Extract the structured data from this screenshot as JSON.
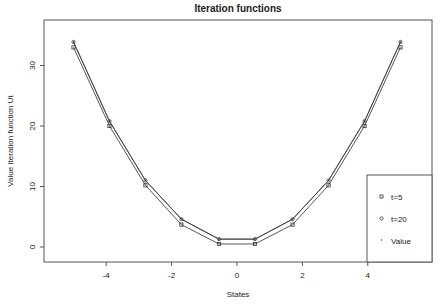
{
  "chart_data": {
    "type": "line",
    "title": "Iteration functions",
    "xlabel": "States",
    "ylabel": "Value Iteration function Ut",
    "xlim": [
      -5.7,
      6.0
    ],
    "ylim": [
      -2.5,
      37.5
    ],
    "xticks": [
      -4,
      -2,
      0,
      2,
      4
    ],
    "yticks": [
      0,
      10,
      20,
      30
    ],
    "grid": false,
    "legend_position": "bottom-right",
    "x": [
      -5.0,
      -3.9,
      -2.8,
      -1.7,
      -0.55,
      0.55,
      1.7,
      2.8,
      3.9,
      5.0
    ],
    "series": [
      {
        "name": "t=5",
        "marker": "square",
        "values": [
          33.0,
          20.0,
          10.2,
          3.7,
          0.5,
          0.5,
          3.7,
          10.2,
          20.0,
          33.0
        ]
      },
      {
        "name": "t=20",
        "marker": "circle",
        "values": [
          33.9,
          20.8,
          11.0,
          4.6,
          1.3,
          1.3,
          4.6,
          11.0,
          20.8,
          33.9
        ]
      },
      {
        "name": "Value",
        "marker": "dot",
        "values": [
          33.9,
          20.8,
          11.0,
          4.6,
          1.3,
          1.3,
          4.6,
          11.0,
          20.8,
          33.9
        ]
      }
    ]
  }
}
